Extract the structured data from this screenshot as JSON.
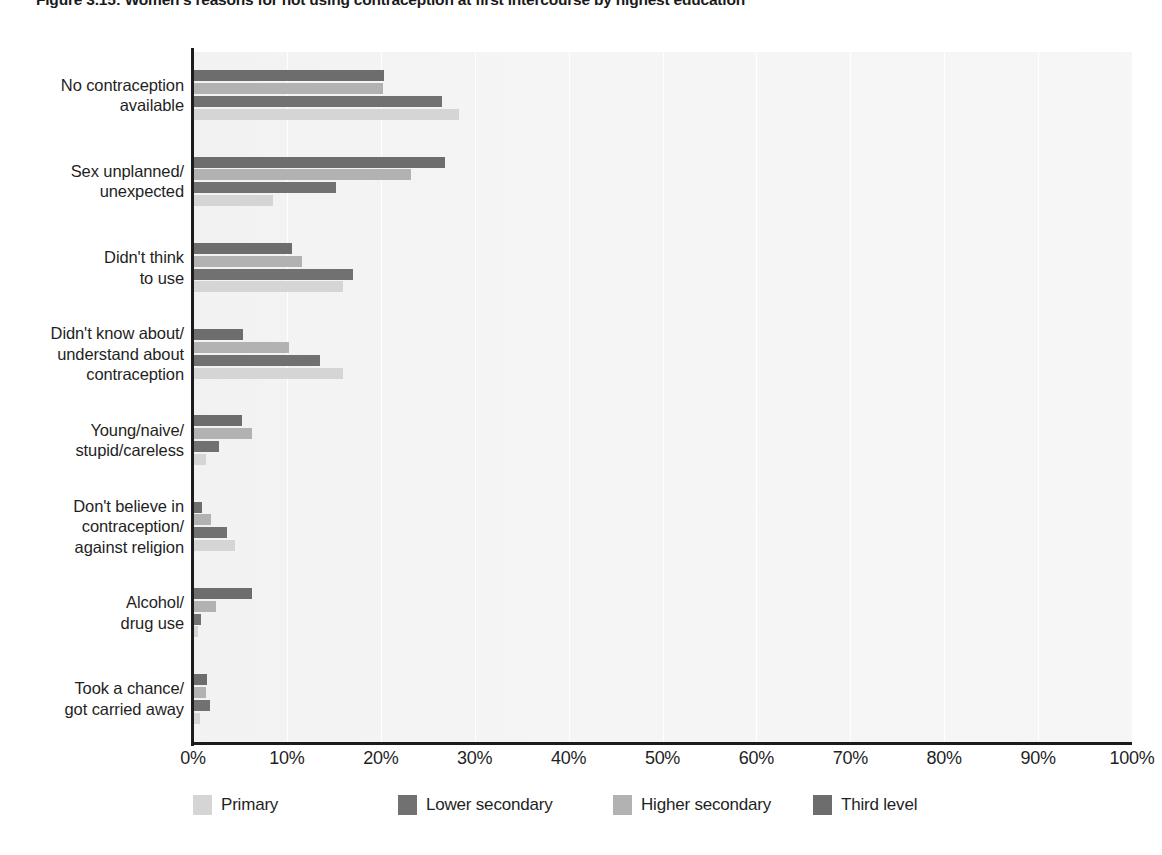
{
  "figure": {
    "title": "Figure 3.15: Women's reasons for not using contraception at first intercourse by highest education"
  },
  "chart_data": {
    "type": "bar",
    "orientation": "horizontal",
    "title": "Figure 3.15: Women's reasons for not using contraception at first intercourse by highest education",
    "xlabel": "",
    "ylabel": "",
    "xlim": [
      0,
      100
    ],
    "xtick_labels": [
      "0%",
      "10%",
      "20%",
      "30%",
      "40%",
      "50%",
      "60%",
      "70%",
      "80%",
      "90%",
      "100%"
    ],
    "xticks": [
      0,
      10,
      20,
      30,
      40,
      50,
      60,
      70,
      80,
      90,
      100
    ],
    "grid": "vertical",
    "legend_position": "bottom",
    "categories": [
      "No contraception\navailable",
      "Sex unplanned/\nunexpected",
      "Didn't think\nto use",
      "Didn't know about/\nunderstand about\ncontraception",
      "Young/naive/\nstupid/careless",
      "Don't believe in\ncontraception/\nagainst religion",
      "Alcohol/\ndrug use",
      "Took a chance/\ngot carried away"
    ],
    "series": [
      {
        "name": "Primary",
        "color": "#d5d5d5",
        "values": [
          28.3,
          8.5,
          16.0,
          16.0,
          1.4,
          4.5,
          0.5,
          0.7
        ]
      },
      {
        "name": "Lower secondary",
        "color": "#717171",
        "values": [
          26.5,
          15.2,
          17.0,
          13.5,
          2.8,
          3.6,
          0.9,
          1.8
        ]
      },
      {
        "name": "Higher secondary",
        "color": "#b2b2b2",
        "values": [
          20.2,
          23.2,
          11.6,
          10.2,
          6.3,
          1.9,
          2.4,
          1.4
        ]
      },
      {
        "name": "Third level",
        "color": "#6d6d6d",
        "values": [
          20.3,
          26.8,
          10.5,
          5.3,
          5.2,
          1.0,
          6.3,
          1.5
        ]
      }
    ]
  },
  "legend": {
    "items": [
      {
        "label": "Primary",
        "color": "#d5d5d5"
      },
      {
        "label": "Lower secondary",
        "color": "#717171"
      },
      {
        "label": "Higher secondary",
        "color": "#b2b2b2"
      },
      {
        "label": "Third level",
        "color": "#6d6d6d"
      }
    ]
  },
  "colors": {
    "plot_background": "#f4f4f4",
    "gridline": "#ffffff",
    "axis": "#1c1c1c",
    "text": "#1f1f1f"
  }
}
